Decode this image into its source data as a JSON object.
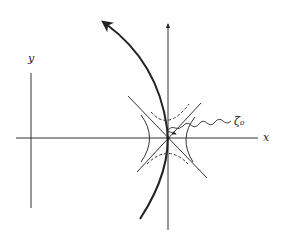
{
  "diagram": {
    "labels": {
      "y_axis": "y",
      "x_axis": "x",
      "point": "ζ₀"
    },
    "colors": {
      "line": "#222222",
      "background": "#ffffff"
    },
    "elements": [
      "small vertical y-axis on left",
      "horizontal x-axis",
      "vertical axis through saddle point with upward arrow",
      "thick curved path with arrow heading up-left",
      "crossing diagonal asymptote lines at saddle point",
      "solid hyperbola branches left and right",
      "dashed hyperbola branches top and bottom",
      "wavy arrow pointing to saddle point labeled ζ₀"
    ]
  }
}
